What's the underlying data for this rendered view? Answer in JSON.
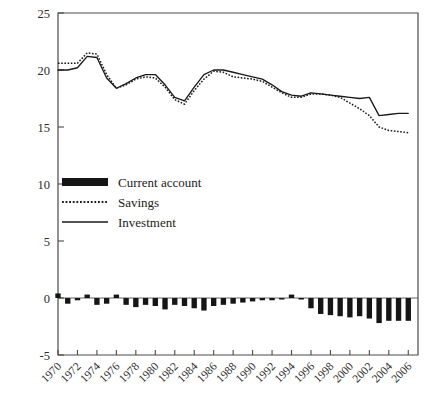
{
  "chart_data": {
    "type": "line",
    "title": "",
    "xlabel": "",
    "ylabel": "",
    "ylim": [
      -5,
      25
    ],
    "xlim": [
      1970,
      2007
    ],
    "grid": false,
    "legend_position": "center-left",
    "y_ticks": [
      "-5",
      "0",
      "5",
      "10",
      "15",
      "20",
      "25"
    ],
    "y_tick_values": [
      -5,
      0,
      5,
      10,
      15,
      20,
      25
    ],
    "x_ticks": [
      "1970",
      "1972",
      "1974",
      "1976",
      "1978",
      "1980",
      "1982",
      "1984",
      "1986",
      "1988",
      "1990",
      "1992",
      "1994",
      "1996",
      "1998",
      "2000",
      "2002",
      "2004",
      "2006"
    ],
    "x_tick_values": [
      1970,
      1972,
      1974,
      1976,
      1978,
      1980,
      1982,
      1984,
      1986,
      1988,
      1990,
      1992,
      1994,
      1996,
      1998,
      2000,
      2002,
      2004,
      2006
    ],
    "x": [
      1970,
      1971,
      1972,
      1973,
      1974,
      1975,
      1976,
      1977,
      1978,
      1979,
      1980,
      1981,
      1982,
      1983,
      1984,
      1985,
      1986,
      1987,
      1988,
      1989,
      1990,
      1991,
      1992,
      1993,
      1994,
      1995,
      1996,
      1997,
      1998,
      1999,
      2000,
      2001,
      2002,
      2003,
      2004,
      2005,
      2006
    ],
    "series": [
      {
        "name": "Current account",
        "kind": "bar",
        "values": [
          0.4,
          -0.5,
          -0.2,
          0.3,
          -0.6,
          -0.5,
          0.3,
          -0.6,
          -0.8,
          -0.6,
          -0.7,
          -1.0,
          -0.6,
          -0.7,
          -0.9,
          -1.1,
          -0.7,
          -0.6,
          -0.5,
          -0.4,
          -0.3,
          -0.2,
          -0.2,
          -0.1,
          0.3,
          -0.1,
          -0.9,
          -1.4,
          -1.5,
          -1.6,
          -1.7,
          -1.6,
          -1.8,
          -2.2,
          -2.0,
          -2.0,
          -2.0
        ]
      },
      {
        "name": "Savings",
        "kind": "line-dotted",
        "values": [
          20.6,
          20.6,
          20.6,
          21.5,
          21.4,
          19.6,
          18.4,
          18.7,
          19.2,
          19.4,
          19.3,
          18.5,
          17.4,
          17.0,
          18.2,
          19.2,
          19.9,
          19.8,
          19.4,
          19.3,
          19.2,
          19.0,
          18.5,
          18.0,
          17.6,
          17.6,
          17.9,
          17.9,
          17.8,
          17.6,
          17.1,
          16.6,
          16.0,
          15.0,
          14.7,
          14.6,
          14.5
        ]
      },
      {
        "name": "Investment",
        "kind": "line-solid",
        "values": [
          20.0,
          20.0,
          20.2,
          21.2,
          21.1,
          19.3,
          18.4,
          18.8,
          19.3,
          19.6,
          19.6,
          18.7,
          17.6,
          17.3,
          18.5,
          19.6,
          20.0,
          20.0,
          19.8,
          19.6,
          19.4,
          19.2,
          18.7,
          18.1,
          17.8,
          17.7,
          18.0,
          17.9,
          17.8,
          17.7,
          17.6,
          17.5,
          17.6,
          16.0,
          16.1,
          16.2,
          16.2
        ]
      }
    ]
  },
  "legend": {
    "items": [
      {
        "label": "Current account",
        "style": "bar"
      },
      {
        "label": "Savings",
        "style": "dotted"
      },
      {
        "label": "Investment",
        "style": "solid"
      }
    ]
  }
}
